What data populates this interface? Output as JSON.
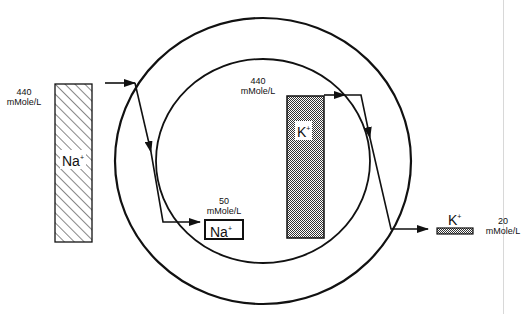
{
  "diagram": {
    "type": "Na+/K+ ion concentration across cell membranes",
    "left_sodium": {
      "value": "440",
      "unit": "mMole/L",
      "ion": "Na",
      "charge": "+"
    },
    "inner_sodium": {
      "value": "50",
      "unit": "mMole/L",
      "ion": "Na",
      "charge": "+"
    },
    "inner_potassium": {
      "value": "440",
      "unit": "mMole/L",
      "ion": "K",
      "charge": "+"
    },
    "right_potassium": {
      "value": "20",
      "unit": "mMole/L",
      "ion": "K",
      "charge": "+"
    },
    "colors": {
      "line": "#111111",
      "background": "#ffffff",
      "stipple": "#555555"
    }
  }
}
